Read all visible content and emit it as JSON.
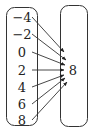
{
  "diagram": {
    "type": "mapping",
    "domain": [
      "−4",
      "−2",
      "0",
      "2",
      "4",
      "6",
      "8"
    ],
    "range": [
      "8"
    ],
    "mappings": [
      {
        "from": "−4",
        "to": "8"
      },
      {
        "from": "−2",
        "to": "8"
      },
      {
        "from": "0",
        "to": "8"
      },
      {
        "from": "2",
        "to": "8"
      },
      {
        "from": "4",
        "to": "8"
      },
      {
        "from": "6",
        "to": "8"
      },
      {
        "from": "8",
        "to": "8"
      }
    ],
    "colors": {
      "stroke": "#333333",
      "text": "#222222",
      "background": "#ffffff"
    }
  }
}
